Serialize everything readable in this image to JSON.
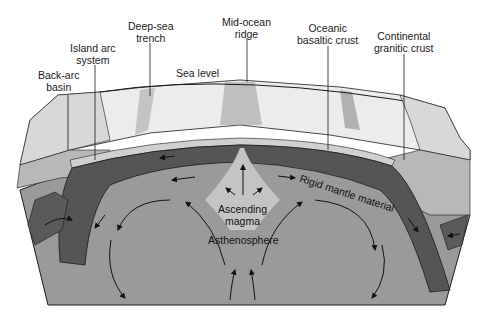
{
  "diagram": {
    "type": "block diagram of seafloor spreading and subduction",
    "labels": {
      "back_arc_basin": "Back-arc\nbasin",
      "island_arc_system": "Island arc\nsystem",
      "deep_sea_trench": "Deep-sea\ntrench",
      "mid_ocean_ridge": "Mid-ocean\nridge",
      "oceanic_basaltic_crust": "Oceanic\nbasaltic crust",
      "continental_granitic_crust": "Continental\ngranitic crust",
      "sea_level": "Sea level",
      "rigid_mantle_material": "Rigid mantle material",
      "ascending_magma": "Ascending\nmagma",
      "asthenosphere": "Asthenosphere"
    },
    "colors": {
      "ocean_surface": "#ececec",
      "crust_light": "#c8c8c8",
      "rigid_mantle": "#555555",
      "asthenosphere": "#9a9a9a",
      "magma": "#c4c4c4",
      "continental_crust": "#b8b8b8",
      "outline": "#1a1a1a"
    }
  }
}
